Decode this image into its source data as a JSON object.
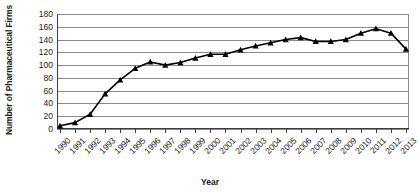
{
  "chart_data": {
    "type": "line",
    "title": "",
    "xlabel": "Year",
    "ylabel": "Number of Pharmaceutical Firms",
    "ylim": [
      0,
      180
    ],
    "yticks": [
      0,
      20,
      40,
      60,
      80,
      100,
      120,
      140,
      160,
      180
    ],
    "grid": true,
    "legend": "none",
    "marker": "triangle",
    "line_color": "#000000",
    "grid_color": "#8a8a8a",
    "categories": [
      "1990",
      "1991",
      "1992",
      "1993",
      "1994",
      "1995",
      "1996",
      "1997",
      "1998",
      "1999",
      "2000",
      "2001",
      "2002",
      "2003",
      "2004",
      "2005",
      "2006",
      "2007",
      "2008",
      "2009",
      "2010",
      "2011",
      "2012",
      "2013"
    ],
    "values": [
      5,
      10,
      23,
      55,
      77,
      95,
      105,
      100,
      104,
      111,
      117,
      117,
      124,
      130,
      135,
      140,
      143,
      137,
      137,
      140,
      150,
      157,
      150,
      125
    ],
    "series": [
      {
        "name": "Number of Pharmaceutical Firms",
        "values": [
          5,
          10,
          23,
          55,
          77,
          95,
          105,
          100,
          104,
          111,
          117,
          117,
          124,
          130,
          135,
          140,
          143,
          137,
          137,
          140,
          150,
          157,
          150,
          125
        ]
      }
    ]
  }
}
